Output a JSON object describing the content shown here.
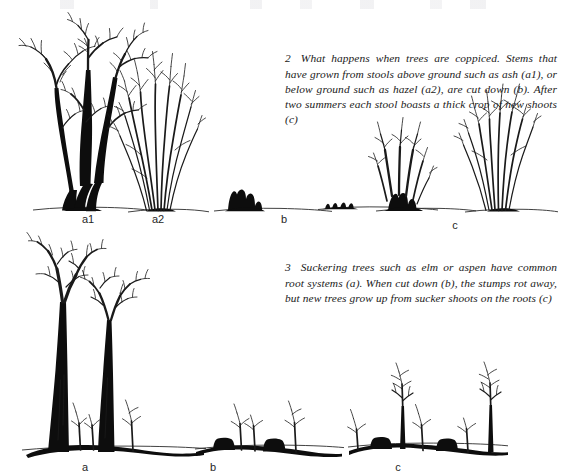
{
  "page": {
    "width": 561,
    "height": 474,
    "background_color": "#ffffff",
    "ink_color": "#111111",
    "medium": "scanned book page, pen-and-ink botanical diagrams with italic serif captions"
  },
  "captions": [
    {
      "number": "2",
      "text": "What happens when trees are coppiced. Stems that have grown from stools above ground such as ash (a1), or below ground such as hazel (a2), are cut down (b). After two summers each stool boasts a thick crop of new shoots (c)"
    },
    {
      "number": "3",
      "text": "Suckering trees such as elm or aspen have common root systems (a). When cut down (b), the stumps rot away, but new trees grow up from sucker shoots on the roots (c)"
    }
  ],
  "figures": [
    {
      "id": "figure-2",
      "caption_ref": "2",
      "labels": [
        {
          "key": "a1",
          "text": "a1",
          "x": 88,
          "y": 219,
          "describes": "ash stool, stems grown above ground"
        },
        {
          "key": "a2",
          "text": "a2",
          "x": 158,
          "y": 219,
          "describes": "hazel stool, stems grown below ground"
        },
        {
          "key": "b",
          "text": "b",
          "x": 284,
          "y": 219,
          "describes": "stems cut down to the stool"
        },
        {
          "key": "c",
          "text": "c",
          "x": 455,
          "y": 225,
          "describes": "new shoots after two summers"
        }
      ]
    },
    {
      "id": "figure-3",
      "caption_ref": "3",
      "labels": [
        {
          "key": "a",
          "text": "a",
          "x": 85,
          "y": 466,
          "describes": "suckering trees with common root system"
        },
        {
          "key": "b",
          "text": "b",
          "x": 213,
          "y": 466,
          "describes": "trees cut down, stumps remain"
        },
        {
          "key": "c",
          "text": "c",
          "x": 398,
          "y": 466,
          "describes": "new trees grown from sucker shoots"
        }
      ]
    }
  ]
}
